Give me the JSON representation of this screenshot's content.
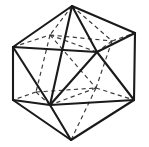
{
  "figure": {
    "shape_name": "icosahedron",
    "canvas": {
      "width": 149,
      "height": 147,
      "background": "#ffffff"
    },
    "style": {
      "visible_edge_color": "#1a1a1a",
      "visible_edge_width": 2.1,
      "hidden_edge_color": "#3a3a3a",
      "hidden_edge_width": 1.15,
      "hidden_edge_dash": "4.2 3.4",
      "face_fill": "#ffffff"
    },
    "counts": {
      "vertices": 12,
      "edges": 30,
      "faces": 20
    },
    "vertices": [
      {
        "id": "T",
        "label": "top-apex",
        "x": 72,
        "y": 6,
        "hidden": false
      },
      {
        "id": "U1",
        "label": "upper-left",
        "x": 13,
        "y": 47,
        "hidden": false
      },
      {
        "id": "U2",
        "label": "upper-back-left",
        "x": 50,
        "y": 35,
        "hidden": true
      },
      {
        "id": "U3",
        "label": "upper-back-right",
        "x": 112,
        "y": 41,
        "hidden": true
      },
      {
        "id": "U4",
        "label": "upper-right",
        "x": 135,
        "y": 33,
        "hidden": false
      },
      {
        "id": "U5",
        "label": "upper-front-right",
        "x": 97,
        "y": 52,
        "hidden": false
      },
      {
        "id": "L1",
        "label": "lower-left",
        "x": 13,
        "y": 100,
        "hidden": false
      },
      {
        "id": "L2",
        "label": "lower-front-left",
        "x": 50,
        "y": 105,
        "hidden": false
      },
      {
        "id": "L3",
        "label": "lower-back-left",
        "x": 36,
        "y": 92,
        "hidden": true
      },
      {
        "id": "L4",
        "label": "lower-back-right",
        "x": 96,
        "y": 88,
        "hidden": true
      },
      {
        "id": "L5",
        "label": "lower-right",
        "x": 134,
        "y": 100,
        "hidden": false
      },
      {
        "id": "B",
        "label": "bottom-apex",
        "x": 71,
        "y": 140,
        "hidden": false
      }
    ],
    "edges_visible": [
      {
        "from": "T",
        "to": "U1"
      },
      {
        "from": "T",
        "to": "U4"
      },
      {
        "from": "T",
        "to": "U5"
      },
      {
        "from": "T",
        "to": "L2"
      },
      {
        "from": "U1",
        "to": "U5"
      },
      {
        "from": "U1",
        "to": "L1"
      },
      {
        "from": "U1",
        "to": "L2"
      },
      {
        "from": "U4",
        "to": "U5"
      },
      {
        "from": "U4",
        "to": "L5"
      },
      {
        "from": "U5",
        "to": "L2"
      },
      {
        "from": "U5",
        "to": "L5"
      },
      {
        "from": "L1",
        "to": "L2"
      },
      {
        "from": "L1",
        "to": "B"
      },
      {
        "from": "L2",
        "to": "B"
      },
      {
        "from": "L5",
        "to": "L2"
      },
      {
        "from": "L5",
        "to": "B"
      }
    ],
    "edges_hidden": [
      {
        "from": "T",
        "to": "U2"
      },
      {
        "from": "T",
        "to": "U3"
      },
      {
        "from": "U1",
        "to": "U2"
      },
      {
        "from": "U2",
        "to": "U3"
      },
      {
        "from": "U3",
        "to": "U4"
      },
      {
        "from": "U2",
        "to": "L3"
      },
      {
        "from": "U2",
        "to": "L4"
      },
      {
        "from": "U3",
        "to": "L4"
      },
      {
        "from": "U3",
        "to": "U5"
      },
      {
        "from": "U2",
        "to": "U5"
      },
      {
        "from": "L3",
        "to": "L1"
      },
      {
        "from": "L3",
        "to": "L4"
      },
      {
        "from": "L3",
        "to": "L2"
      },
      {
        "from": "L4",
        "to": "L5"
      },
      {
        "from": "L4",
        "to": "L2"
      },
      {
        "from": "L4",
        "to": "B"
      }
    ]
  }
}
